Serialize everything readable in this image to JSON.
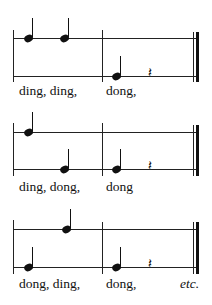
{
  "systems": [
    {
      "lyrics": [
        "ding, ding,",
        "dong,"
      ],
      "notes": [
        {
          "syllable": "ding",
          "line": "upper"
        },
        {
          "syllable": "ding",
          "line": "upper"
        },
        {
          "syllable": "dong",
          "line": "lower"
        }
      ],
      "rest": "quarter-rest"
    },
    {
      "lyrics": [
        "ding, dong,",
        "dong"
      ],
      "notes": [
        {
          "syllable": "ding",
          "line": "upper"
        },
        {
          "syllable": "dong",
          "line": "lower"
        },
        {
          "syllable": "dong",
          "line": "lower"
        }
      ],
      "rest": "quarter-rest"
    },
    {
      "lyrics": [
        "dong, ding,",
        "dong,",
        "etc."
      ],
      "notes": [
        {
          "syllable": "dong",
          "line": "lower"
        },
        {
          "syllable": "ding",
          "line": "upper"
        },
        {
          "syllable": "dong",
          "line": "lower"
        }
      ],
      "rest": "quarter-rest"
    }
  ],
  "glyphs": {
    "rest": "𝄽"
  }
}
